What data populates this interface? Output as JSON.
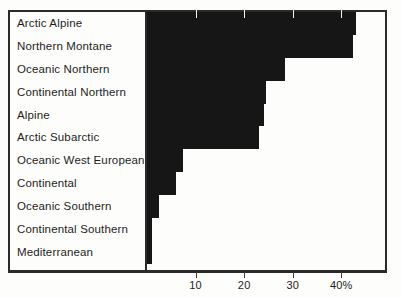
{
  "chart_data": {
    "type": "bar",
    "orientation": "horizontal",
    "title": "",
    "subtitle": "",
    "xlabel": "",
    "ylabel": "",
    "xlim": [
      0,
      49
    ],
    "grid": false,
    "legend": null,
    "x_unit": "%",
    "categories": [
      "Arctic Alpine",
      "Northern Montane",
      "Oceanic Northern",
      "Continental Northern",
      "Alpine",
      "Arctic Subarctic",
      "Oceanic West European",
      "Continental",
      "Oceanic Southern",
      "Continental Southern",
      "Mediterranean"
    ],
    "values": [
      43,
      42.5,
      28.5,
      24.5,
      24,
      23,
      7.5,
      6,
      2.5,
      1,
      1
    ],
    "ticks": [
      {
        "value": 10,
        "label": "10"
      },
      {
        "value": 20,
        "label": "20"
      },
      {
        "value": 30,
        "label": "30"
      },
      {
        "value": 40,
        "label": "40%"
      }
    ],
    "bar_color": "#161616",
    "axis_color": "#2b2b2b",
    "background": "#fdfdfc"
  }
}
